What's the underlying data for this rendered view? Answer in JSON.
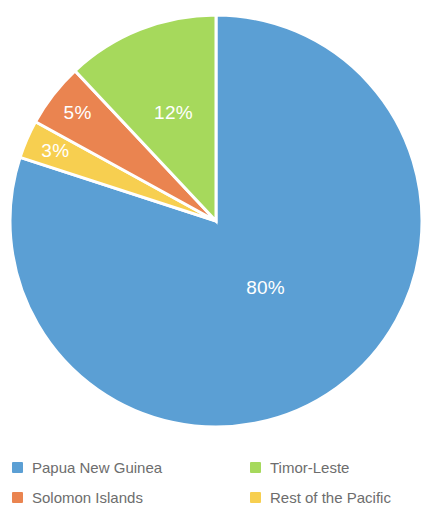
{
  "chart_data": {
    "type": "pie",
    "title": "",
    "subtitle": "",
    "xlabel": "",
    "ylabel": "",
    "unit": "%",
    "grid": false,
    "legend_position": "bottom",
    "start_angle_deg": 0,
    "direction": "clockwise",
    "categories": [
      "Papua New Guinea",
      "Timor-Leste",
      "Solomon Islands",
      "Rest of the Pacific"
    ],
    "values": [
      80,
      12,
      5,
      3
    ],
    "slices": [
      {
        "name": "Papua New Guinea",
        "value": 80,
        "label": "80%",
        "color": "#5b9fd4",
        "label_color": "#ffffff",
        "order": 1
      },
      {
        "name": "Timor-Leste",
        "value": 12,
        "label": "12%",
        "color": "#a6d95c",
        "label_color": "#ffffff",
        "order": 4
      },
      {
        "name": "Solomon Islands",
        "value": 5,
        "label": "5%",
        "color": "#ea8450",
        "label_color": "#ffffff",
        "order": 3
      },
      {
        "name": "Rest of the Pacific",
        "value": 3,
        "label": "3%",
        "color": "#f7cf50",
        "label_color": "#ffffff",
        "order": 2
      }
    ]
  },
  "pie": {
    "center_x": 216,
    "center_y": 221,
    "radius": 206,
    "gap_color": "#ffffff",
    "labels": {
      "papua_new_guinea": "80%",
      "timor_leste": "12%",
      "solomon_islands": "5%",
      "rest_of_the_pacific": "3%"
    }
  },
  "legend": {
    "text_color": "#6d6d6d",
    "items": [
      {
        "label": "Papua New Guinea",
        "color": "#5b9fd4",
        "column": "left",
        "row": 1
      },
      {
        "label": "Timor-Leste",
        "color": "#a6d95c",
        "column": "right",
        "row": 1
      },
      {
        "label": "Solomon Islands",
        "color": "#ea8450",
        "column": "left",
        "row": 2
      },
      {
        "label": "Rest of the Pacific",
        "color": "#f7cf50",
        "column": "right",
        "row": 2
      }
    ]
  }
}
